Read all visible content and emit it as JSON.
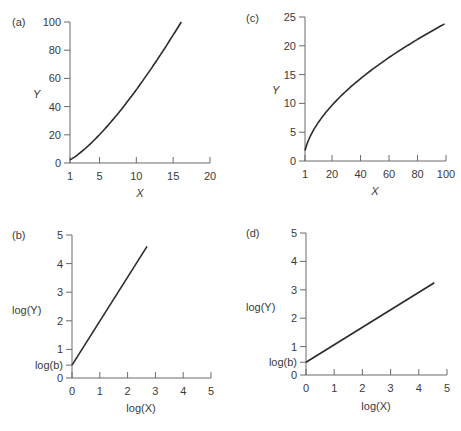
{
  "chart_data": [
    {
      "panel": "(a)",
      "type": "line",
      "xlabel": "X",
      "ylabel": "Y",
      "xticks": [
        "1",
        "5",
        "10",
        "15",
        "20"
      ],
      "xtick_values": [
        1,
        5,
        10,
        15,
        20
      ],
      "yticks": [
        "0",
        "20",
        "40",
        "60",
        "80",
        "100"
      ],
      "ytick_values": [
        0,
        20,
        40,
        60,
        80,
        100
      ],
      "xlim": [
        1,
        20
      ],
      "ylim": [
        0,
        100
      ],
      "x": [
        1,
        2,
        3,
        4,
        5,
        6,
        7,
        8,
        9,
        10,
        11,
        12,
        13,
        14,
        15,
        16.1
      ],
      "y": [
        2.2,
        5.0,
        8.2,
        11.8,
        15.8,
        20.2,
        25.0,
        30.2,
        35.8,
        41.8,
        48.2,
        55.0,
        62.2,
        69.8,
        77.8,
        100
      ],
      "description": "Convex increasing curve, Y = bX^a with a > 1"
    },
    {
      "panel": "(c)",
      "type": "line",
      "xlabel": "X",
      "ylabel": "Y",
      "xticks": [
        "1",
        "20",
        "40",
        "60",
        "80",
        "100"
      ],
      "xtick_values": [
        1,
        20,
        40,
        60,
        80,
        100
      ],
      "yticks": [
        "0",
        "5",
        "10",
        "15",
        "20",
        "25"
      ],
      "ytick_values": [
        0,
        5,
        10,
        15,
        20,
        25
      ],
      "xlim": [
        1,
        100
      ],
      "ylim": [
        0,
        25
      ],
      "x": [
        1,
        3,
        5,
        10,
        20,
        30,
        40,
        50,
        60,
        70,
        80,
        90,
        99
      ],
      "y": [
        1.8,
        4.0,
        5.2,
        7.2,
        9.9,
        12.0,
        13.8,
        15.4,
        16.9,
        18.3,
        20.0,
        21.6,
        23.8
      ],
      "description": "Concave increasing curve, Y = bX^a with a < 1"
    },
    {
      "panel": "(b)",
      "type": "line",
      "xlabel": "log(X)",
      "ylabel": "log(Y)",
      "xticks": [
        "0",
        "1",
        "2",
        "3",
        "4",
        "5"
      ],
      "xtick_values": [
        0,
        1,
        2,
        3,
        4,
        5
      ],
      "yticks": [
        "0",
        "1",
        "2",
        "3",
        "4",
        "5"
      ],
      "ytick_values": [
        0,
        1,
        2,
        3,
        4,
        5
      ],
      "extra_ytick_label": "log(b)",
      "extra_ytick_value": 0.45,
      "xlim": [
        0,
        5
      ],
      "ylim": [
        0,
        5
      ],
      "x": [
        0,
        2.7
      ],
      "y": [
        0.45,
        4.6
      ],
      "description": "Straight line, intercept log(b), slope > 1"
    },
    {
      "panel": "(d)",
      "type": "line",
      "xlabel": "log(X)",
      "ylabel": "log(Y)",
      "xticks": [
        "0",
        "1",
        "2",
        "3",
        "4",
        "5"
      ],
      "xtick_values": [
        0,
        1,
        2,
        3,
        4,
        5
      ],
      "yticks": [
        "0",
        "1",
        "2",
        "3",
        "4",
        "5"
      ],
      "ytick_values": [
        0,
        1,
        2,
        3,
        4,
        5
      ],
      "extra_ytick_label": "log(b)",
      "extra_ytick_value": 0.45,
      "xlim": [
        0,
        5
      ],
      "ylim": [
        0,
        5
      ],
      "x": [
        0,
        4.55
      ],
      "y": [
        0.45,
        3.25
      ],
      "description": "Straight line, intercept log(b), slope < 1"
    }
  ],
  "layout": [
    {
      "x0": 70,
      "x1": 210,
      "y0": 163,
      "y1": 22,
      "label_x": 12,
      "label_y": 26,
      "ylabel_x": 33,
      "ylabel_y": 98,
      "xlabel_x": 140,
      "xlabel_y": 197
    },
    {
      "x0": 305,
      "x1": 446,
      "y0": 161,
      "y1": 17,
      "label_x": 246,
      "label_y": 22,
      "ylabel_x": 272,
      "ylabel_y": 94,
      "xlabel_x": 375,
      "xlabel_y": 195
    },
    {
      "x0": 72,
      "x1": 211,
      "y0": 378,
      "y1": 235,
      "label_x": 12,
      "label_y": 239,
      "ylabel_x": 12,
      "ylabel_y": 314,
      "xlabel_x": 141,
      "xlabel_y": 412
    },
    {
      "x0": 306,
      "x1": 447,
      "y0": 375,
      "y1": 233,
      "label_x": 246,
      "label_y": 237,
      "ylabel_x": 246,
      "ylabel_y": 311,
      "xlabel_x": 376,
      "xlabel_y": 410
    }
  ]
}
